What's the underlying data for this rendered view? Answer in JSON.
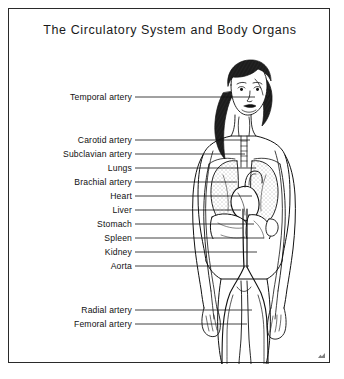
{
  "figure": {
    "title": "The Circulatory System and Body Organs",
    "frame_color": "#2a2a2a",
    "ink_color": "#111111",
    "background_color": "#ffffff"
  },
  "labels": [
    {
      "text": "Temporal artery",
      "label_right_x": 123,
      "y": 88,
      "leader_end_x": 246
    },
    {
      "text": "Carotid artery",
      "label_right_x": 123,
      "y": 131,
      "leader_end_x": 241
    },
    {
      "text": "Subclavian artery",
      "label_right_x": 123,
      "y": 145,
      "leader_end_x": 236
    },
    {
      "text": "Lungs",
      "label_right_x": 123,
      "y": 159,
      "leader_end_x": 247
    },
    {
      "text": "Brachial artery",
      "label_right_x": 123,
      "y": 173,
      "leader_end_x": 228
    },
    {
      "text": "Heart",
      "label_right_x": 123,
      "y": 187,
      "leader_end_x": 243
    },
    {
      "text": "Liver",
      "label_right_x": 123,
      "y": 201,
      "leader_end_x": 232
    },
    {
      "text": "Stomach",
      "label_right_x": 123,
      "y": 215,
      "leader_end_x": 245
    },
    {
      "text": "Spleen",
      "label_right_x": 123,
      "y": 229,
      "leader_end_x": 255
    },
    {
      "text": "Kidney",
      "label_right_x": 123,
      "y": 243,
      "leader_end_x": 248
    },
    {
      "text": "Aorta",
      "label_right_x": 123,
      "y": 257,
      "leader_end_x": 240
    },
    {
      "text": "Radial artery",
      "label_right_x": 123,
      "y": 301,
      "leader_end_x": 243
    },
    {
      "text": "Femoral artery",
      "label_right_x": 123,
      "y": 315,
      "leader_end_x": 238
    }
  ]
}
